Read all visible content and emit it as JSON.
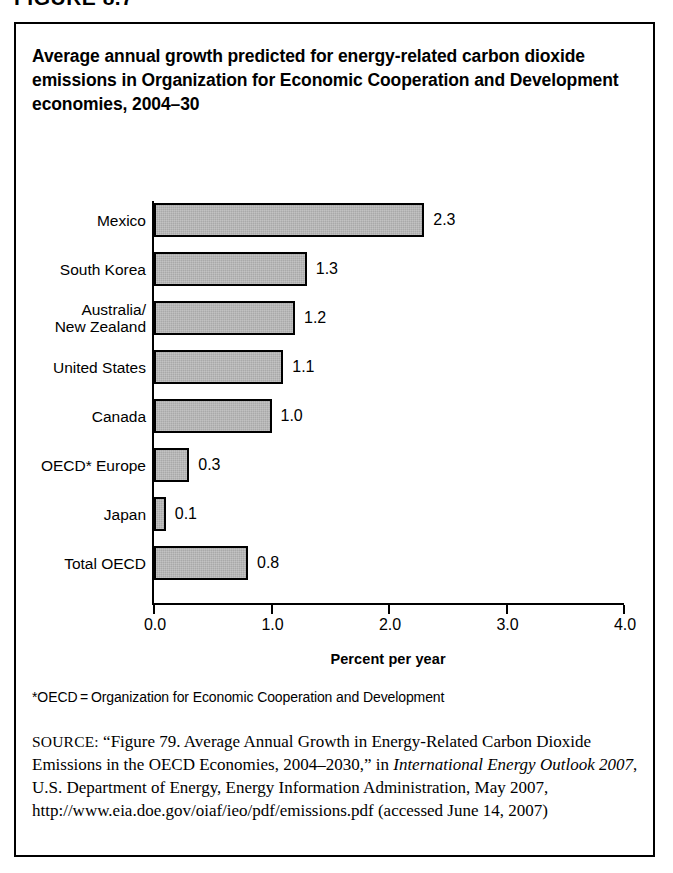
{
  "figure_header": "FIGURE 8.7",
  "title": "Average annual growth predicted for energy-related carbon dioxide emissions in Organization for Economic Cooperation and Development economies, 2004–30",
  "footnote": "*OECD = Organization for Economic Cooperation and Development",
  "source": {
    "label": "SOURCE:",
    "part1": " “Figure 79. Average Annual Growth in Energy-Related Carbon Dioxide Emissions in the OECD Economies, 2004–2030,” in ",
    "italic": "International Energy Outlook 2007",
    "part2": ", U.S. Department of Energy, Energy Information Administration, May 2007, http://www.eia.doe.gov/oiaf/ieo/pdf/emissions.pdf (accessed June 14, 2007)"
  },
  "chart_data": {
    "type": "bar",
    "orientation": "horizontal",
    "title": "Average annual growth predicted for energy-related carbon dioxide emissions in Organization for Economic Cooperation and Development economies, 2004–30",
    "xlabel": "Percent per year",
    "ylabel": "",
    "xlim": [
      0.0,
      4.0
    ],
    "xticks": [
      "0.0",
      "1.0",
      "2.0",
      "3.0",
      "4.0"
    ],
    "xtick_values": [
      0.0,
      1.0,
      2.0,
      3.0,
      4.0
    ],
    "grid": false,
    "legend": false,
    "bar_fill": "#a9a9a9",
    "bar_border": "#000000",
    "categories": [
      "Mexico",
      "South Korea",
      "Australia/\nNew Zealand",
      "United States",
      "Canada",
      "OECD* Europe",
      "Japan",
      "Total OECD"
    ],
    "values": [
      2.3,
      1.3,
      1.2,
      1.1,
      1.0,
      0.3,
      0.1,
      0.8
    ],
    "value_labels": [
      "2.3",
      "1.3",
      "1.2",
      "1.1",
      "1.0",
      "0.3",
      "0.1",
      "0.8"
    ]
  }
}
